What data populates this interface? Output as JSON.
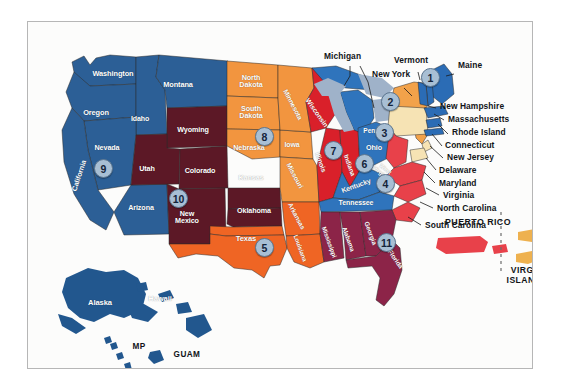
{
  "frame": {
    "border_color": "#b6b6b6",
    "background": "#fcfcfb"
  },
  "palette": {
    "region1_blue": "#2b6cb5",
    "region2_orange": "#f2a24a",
    "region3_cream": "#f6e3b4",
    "region4_red": "#e8414a",
    "region5_orange_red": "#ef6524",
    "region6_blue": "#2f74bc",
    "region7_red": "#d9202a",
    "region8_orange": "#f2953f",
    "region9_steel_blue": "#2c5f96",
    "region10_maroon": "#5c1826",
    "region11_purple": "#8c2448",
    "territory_blue": "#22578e",
    "great_lakes": "#9fb2c9",
    "puerto_rico_red": "#e8414a",
    "virgin_islands_tan": "#eeb14f",
    "badge_fill": "#a8bfd4",
    "badge_border": "#5d7791",
    "badge_text": "#14243a",
    "callout_text": "#111418",
    "state_label_white": "#ffffff"
  },
  "regions": [
    {
      "number": "1",
      "color": "#2b6cb5",
      "states": [
        "Maine",
        "New Hampshire",
        "Vermont",
        "Massachusetts",
        "Rhode Island",
        "Connecticut"
      ]
    },
    {
      "number": "2",
      "color": "#f2a24a",
      "states": [
        "New York",
        "New Jersey"
      ]
    },
    {
      "number": "3",
      "color": "#f6e3b4",
      "states": [
        "Pennsylvania",
        "Delaware",
        "Maryland",
        "Virginia",
        "West Virginia"
      ]
    },
    {
      "number": "4",
      "color": "#e8414a",
      "states": [
        "North Carolina",
        "South Carolina",
        "Virginia"
      ]
    },
    {
      "number": "5",
      "color": "#ef6524",
      "states": [
        "Texas",
        "Oklahoma",
        "Arkansas",
        "Louisiana",
        "New Mexico"
      ]
    },
    {
      "number": "6",
      "color": "#2f74bc",
      "states": [
        "Ohio",
        "Kentucky",
        "Tennessee",
        "Michigan"
      ]
    },
    {
      "number": "7",
      "color": "#d9202a",
      "states": [
        "Illinois",
        "Indiana",
        "Wisconsin"
      ]
    },
    {
      "number": "8",
      "color": "#f2953f",
      "states": [
        "North Dakota",
        "South Dakota",
        "Nebraska",
        "Iowa",
        "Minnesota",
        "Missouri",
        "Kansas"
      ]
    },
    {
      "number": "9",
      "color": "#2c5f96",
      "states": [
        "California",
        "Nevada",
        "Arizona",
        "Oregon",
        "Washington",
        "Idaho",
        "Montana"
      ]
    },
    {
      "number": "10",
      "color": "#5c1826",
      "states": [
        "Utah",
        "Colorado",
        "New Mexico",
        "Wyoming",
        "Kansas"
      ]
    },
    {
      "number": "11",
      "color": "#8c2448",
      "states": [
        "Florida",
        "Georgia",
        "Alabama",
        "Mississippi"
      ]
    }
  ],
  "badges": [
    {
      "label": "1",
      "x": 402,
      "y": 55
    },
    {
      "label": "2",
      "x": 362,
      "y": 79
    },
    {
      "label": "3",
      "x": 356,
      "y": 110
    },
    {
      "label": "4",
      "x": 357,
      "y": 161
    },
    {
      "label": "5",
      "x": 236,
      "y": 225
    },
    {
      "label": "6",
      "x": 336,
      "y": 141
    },
    {
      "label": "7",
      "x": 305,
      "y": 128
    },
    {
      "label": "8",
      "x": 236,
      "y": 114
    },
    {
      "label": "9",
      "x": 75,
      "y": 146
    },
    {
      "label": "10",
      "x": 150,
      "y": 176
    },
    {
      "label": "11",
      "x": 358,
      "y": 220
    }
  ],
  "state_labels": [
    {
      "name": "Washington",
      "x": 85,
      "y": 54,
      "size": 7.4,
      "rot": 0
    },
    {
      "name": "Oregon",
      "x": 68,
      "y": 93,
      "size": 7.4,
      "rot": 0
    },
    {
      "name": "Idaho",
      "x": 112,
      "y": 99,
      "size": 7.0,
      "rot": 0
    },
    {
      "name": "Montana",
      "x": 150,
      "y": 65,
      "size": 7.4,
      "rot": 0
    },
    {
      "name": "Nevada",
      "x": 79,
      "y": 128,
      "size": 7.2,
      "rot": 0
    },
    {
      "name": "California",
      "x": 51,
      "y": 155,
      "size": 7.2,
      "rot": -72
    },
    {
      "name": "Utah",
      "x": 119,
      "y": 149,
      "size": 7.2,
      "rot": 0
    },
    {
      "name": "Arizona",
      "x": 113,
      "y": 188,
      "size": 7.2,
      "rot": 0
    },
    {
      "name": "Wyoming",
      "x": 165,
      "y": 110,
      "size": 7.2,
      "rot": 0
    },
    {
      "name": "Colorado",
      "x": 172,
      "y": 151,
      "size": 7.2,
      "rot": 0
    },
    {
      "name": "New\nMexico",
      "x": 159,
      "y": 194,
      "size": 7.2,
      "rot": 0
    },
    {
      "name": "North\nDakota",
      "x": 222,
      "y": 63,
      "size": 7.2,
      "rot": 0
    },
    {
      "name": "South\nDakota",
      "x": 222,
      "y": 94,
      "size": 7.2,
      "rot": 0
    },
    {
      "name": "Nebraska",
      "x": 221,
      "y": 128,
      "size": 7.2,
      "rot": 0
    },
    {
      "name": "Kansas",
      "x": 223,
      "y": 158,
      "size": 7.2,
      "rot": 0
    },
    {
      "name": "Oklahoma",
      "x": 226,
      "y": 191,
      "size": 7.2,
      "rot": 0
    },
    {
      "name": "Texas",
      "x": 218,
      "y": 219,
      "size": 7.6,
      "rot": 0
    },
    {
      "name": "Minnesota",
      "x": 265,
      "y": 84,
      "size": 6.9,
      "rot": 62
    },
    {
      "name": "Iowa",
      "x": 264,
      "y": 124,
      "size": 7.0,
      "rot": 0
    },
    {
      "name": "Missouri",
      "x": 267,
      "y": 155,
      "size": 6.9,
      "rot": 62
    },
    {
      "name": "Arkansas",
      "x": 268,
      "y": 196,
      "size": 6.6,
      "rot": 62
    },
    {
      "name": "Louisiana",
      "x": 272,
      "y": 228,
      "size": 6.2,
      "rot": 70
    },
    {
      "name": "Wisconsin",
      "x": 289,
      "y": 92,
      "size": 6.9,
      "rot": 55
    },
    {
      "name": "Illinois",
      "x": 292,
      "y": 142,
      "size": 6.8,
      "rot": 70
    },
    {
      "name": "Indiana",
      "x": 320,
      "y": 145,
      "size": 6.6,
      "rot": 70
    },
    {
      "name": "Ohio",
      "x": 345,
      "y": 127,
      "size": 7.2,
      "rot": 0
    },
    {
      "name": "Kentucky",
      "x": 327,
      "y": 166,
      "size": 7.0,
      "rot": -20
    },
    {
      "name": "Tennessee",
      "x": 327,
      "y": 182,
      "size": 7.0,
      "rot": 0
    },
    {
      "name": "Mississippi",
      "x": 300,
      "y": 222,
      "size": 6.2,
      "rot": 70
    },
    {
      "name": "Alabama",
      "x": 319,
      "y": 219,
      "size": 6.4,
      "rot": 70
    },
    {
      "name": "Georgia",
      "x": 341,
      "y": 213,
      "size": 6.6,
      "rot": 70
    },
    {
      "name": "Florida",
      "x": 367,
      "y": 239,
      "size": 6.6,
      "rot": 55
    },
    {
      "name": "West\nVirginia",
      "x": 354,
      "y": 152,
      "size": 5.8,
      "rot": 40
    },
    {
      "name": "Michigan",
      "x": 0,
      "y": 0,
      "size": 0,
      "rot": 0
    },
    {
      "name": "Penns",
      "x": 344,
      "y": 110,
      "size": 6.6,
      "rot": 0
    },
    {
      "name": "Alaska",
      "x": 70,
      "y": 283,
      "size": 7.6,
      "rot": 0
    },
    {
      "name": "Hawaii",
      "x": 130,
      "y": 279,
      "size": 7.6,
      "rot": 0
    }
  ],
  "callouts": [
    {
      "label": "Michigan",
      "x": 314,
      "y": 35,
      "leader": true
    },
    {
      "label": "Vermont",
      "x": 383,
      "y": 40,
      "leader": true
    },
    {
      "label": "New\nYork",
      "x": 354,
      "y": 60,
      "leader": true
    },
    {
      "label": "Maine",
      "x": 429,
      "y": 44,
      "leader": true
    },
    {
      "label": "New Hampshire",
      "x": 412,
      "y": 84,
      "leader": true
    },
    {
      "label": "Massachusetts",
      "x": 420,
      "y": 97,
      "leader": true
    },
    {
      "label": "Rhode Island",
      "x": 425,
      "y": 110,
      "leader": true
    },
    {
      "label": "Connecticut",
      "x": 417,
      "y": 122,
      "leader": true
    },
    {
      "label": "New Jersey",
      "x": 419,
      "y": 134,
      "leader": true
    },
    {
      "label": "Delaware",
      "x": 411,
      "y": 146,
      "leader": true
    },
    {
      "label": "Maryland",
      "x": 411,
      "y": 159,
      "leader": true
    },
    {
      "label": "Virginia",
      "x": 415,
      "y": 171,
      "leader": true
    },
    {
      "label": "North Carolina",
      "x": 409,
      "y": 184,
      "leader": true
    },
    {
      "label": "South Carolina",
      "x": 397,
      "y": 201,
      "leader": true
    }
  ],
  "territories": [
    {
      "label": "PUERTO RICO",
      "x": 437,
      "y": 200,
      "size": 8.8
    },
    {
      "label": "VIRGIN\nISLANDS",
      "x": 496,
      "y": 248,
      "size": 8.6
    },
    {
      "label": "MP",
      "x": 110,
      "y": 330,
      "size": 8.2
    },
    {
      "label": "GUAM",
      "x": 144,
      "y": 337,
      "size": 8.2
    }
  ]
}
